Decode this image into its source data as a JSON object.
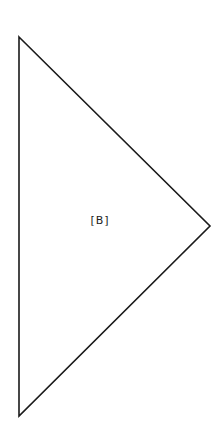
{
  "diagram": {
    "background": "#ffffff",
    "stroke_color": "#1a1a1a",
    "stroke_width": 1.6,
    "shape": "triangle",
    "vertices": {
      "top": [
        19,
        37
      ],
      "right": [
        210,
        226
      ],
      "bottom": [
        19,
        416
      ]
    },
    "label": "[B]"
  }
}
